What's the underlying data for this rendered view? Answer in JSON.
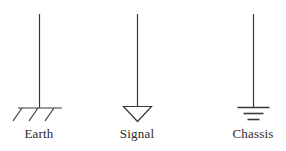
{
  "figure": {
    "title": "",
    "background_color": "#ffffff",
    "line_color": "#3a3a3a",
    "label_color": "#2b2b2b",
    "symbols": [
      {
        "name": "earth-ground",
        "label": "Earth",
        "icon": "earth-ground-icon",
        "stem_x": 39,
        "stem_top_y": 14,
        "stem_bottom_y": 108,
        "bar_x1": 18,
        "bar_x2": 62,
        "bar_y": 108,
        "hatch_count": 3
      },
      {
        "name": "signal-ground",
        "label": "Signal",
        "icon": "signal-ground-triangle-icon",
        "stem_x": 137,
        "stem_top_y": 14,
        "stem_bottom_y": 106,
        "triangle_top_y": 106,
        "triangle_apex_y": 121,
        "triangle_width": 28
      },
      {
        "name": "chassis-ground",
        "label": "Chassis",
        "icon": "chassis-ground-icon",
        "stem_x": 253,
        "stem_top_y": 14,
        "stem_bottom_y": 107,
        "bars": [
          {
            "width": 32,
            "y": 107
          },
          {
            "width": 20,
            "y": 113
          },
          {
            "width": 12,
            "y": 119
          }
        ]
      }
    ]
  }
}
